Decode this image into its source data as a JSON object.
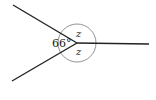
{
  "diagram": {
    "type": "angles-at-a-point",
    "center": [
      77,
      43
    ],
    "rays": [
      {
        "name": "upper-left",
        "end": [
          13,
          5
        ]
      },
      {
        "name": "lower-left",
        "end": [
          12,
          81
        ]
      },
      {
        "name": "right",
        "end": [
          149,
          44
        ]
      }
    ],
    "angle_labels": {
      "left": "66°",
      "upper_right": "z",
      "lower_right": "z"
    },
    "colors": {
      "line": "#222222",
      "arc": "#666666"
    }
  }
}
